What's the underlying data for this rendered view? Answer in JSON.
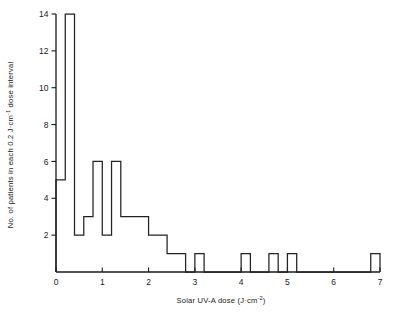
{
  "chart_data": {
    "type": "bar",
    "title": "",
    "subtitle": "",
    "xlabel": "Solar UV-A dose (J·cm⁻²)",
    "ylabel": "No. of patients in each 0.2 J·cm⁻¹ dose interval",
    "xlim": [
      0,
      7
    ],
    "ylim": [
      0,
      14
    ],
    "bin_width": 0.2,
    "grid": false,
    "legend": null,
    "xticks": [
      0,
      1,
      2,
      3,
      4,
      5,
      6,
      7
    ],
    "xtick_labels": [
      "0",
      "1",
      "2",
      "3",
      "4",
      "5",
      "6",
      "7"
    ],
    "yticks": [
      2,
      4,
      6,
      8,
      10,
      12,
      14
    ],
    "ytick_labels": [
      "2",
      "4",
      "6",
      "8",
      "10",
      "12",
      "14"
    ],
    "bin_starts": [
      0.0,
      0.2,
      0.4,
      0.6,
      0.8,
      1.0,
      1.2,
      1.4,
      1.6,
      1.8,
      2.0,
      2.2,
      2.4,
      2.6,
      2.8,
      3.0,
      3.2,
      3.4,
      3.6,
      3.8,
      4.0,
      4.2,
      4.4,
      4.6,
      4.8,
      5.0,
      5.2,
      5.4,
      5.6,
      5.8,
      6.0,
      6.2,
      6.4,
      6.6,
      6.8
    ],
    "values": [
      5,
      14,
      2,
      3,
      6,
      2,
      6,
      3,
      3,
      3,
      2,
      2,
      1,
      1,
      0,
      1,
      0,
      0,
      0,
      0,
      1,
      0,
      0,
      1,
      0,
      1,
      0,
      0,
      0,
      0,
      0,
      0,
      0,
      0,
      1
    ],
    "categories": [
      "0.0-0.2",
      "0.2-0.4",
      "0.4-0.6",
      "0.6-0.8",
      "0.8-1.0",
      "1.0-1.2",
      "1.2-1.4",
      "1.4-1.6",
      "1.6-1.8",
      "1.8-2.0",
      "2.0-2.2",
      "2.2-2.4",
      "2.4-2.6",
      "2.6-2.8",
      "2.8-3.0",
      "3.0-3.2",
      "3.2-3.4",
      "3.4-3.6",
      "3.6-3.8",
      "3.8-4.0",
      "4.0-4.2",
      "4.2-4.4",
      "4.4-4.6",
      "4.6-4.8",
      "4.8-5.0",
      "5.0-5.2",
      "5.2-5.4",
      "5.4-5.6",
      "5.6-5.8",
      "5.8-6.0",
      "6.0-6.2",
      "6.2-6.4",
      "6.4-6.6",
      "6.6-6.8",
      "6.8-7.0"
    ],
    "annotations": [],
    "colors": {
      "line": "#222222",
      "axis": "#1a1a1a",
      "background": "#ffffff"
    }
  },
  "axis_titles": {
    "y_main": "No. of patients in each 0.2 J",
    "y_unit_base": "cm",
    "y_unit_sup": "-1",
    "y_tail": " dose interval",
    "x_main": "Solar UV-A dose (J",
    "x_unit_base": "cm",
    "x_unit_sup": "-2",
    "x_tail": ")"
  }
}
